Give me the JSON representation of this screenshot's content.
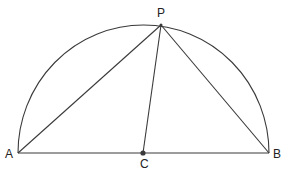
{
  "diagram": {
    "type": "geometry",
    "stroke_color": "#3a3a3a",
    "points": {
      "A": {
        "label": "A",
        "x": 18,
        "y": 153
      },
      "B": {
        "label": "B",
        "x": 269,
        "y": 153
      },
      "C": {
        "label": "C",
        "x": 143,
        "y": 153
      },
      "P": {
        "label": "P",
        "x": 161,
        "y": 25
      }
    },
    "segments": [
      {
        "from": "A",
        "to": "B"
      },
      {
        "from": "A",
        "to": "P"
      },
      {
        "from": "P",
        "to": "B"
      },
      {
        "from": "P",
        "to": "C"
      }
    ],
    "arc": {
      "center": "C",
      "radius": 126,
      "type": "semicircle-upper"
    }
  }
}
